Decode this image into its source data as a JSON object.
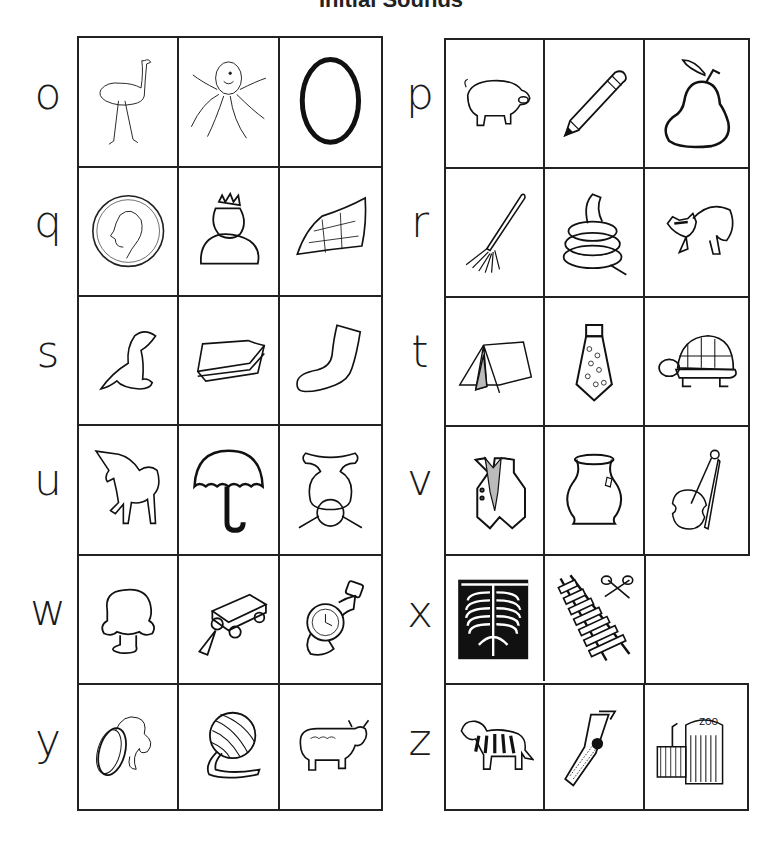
{
  "title": "Initial Sounds",
  "left_panel": {
    "rows": [
      {
        "letter": "o",
        "pictures": [
          "ostrich",
          "octopus",
          "oval"
        ]
      },
      {
        "letter": "q",
        "pictures": [
          "quarter",
          "queen",
          "quilt"
        ]
      },
      {
        "letter": "s",
        "pictures": [
          "seal",
          "sandwich",
          "sock"
        ]
      },
      {
        "letter": "u",
        "pictures": [
          "unicorn",
          "umbrella",
          "upside-down"
        ]
      },
      {
        "letter": "w",
        "pictures": [
          "wig",
          "wagon",
          "watch"
        ]
      },
      {
        "letter": "y",
        "pictures": [
          "yo-yo",
          "yarn",
          "yak"
        ]
      }
    ]
  },
  "right_panel": {
    "rows": [
      {
        "letter": "p",
        "pictures": [
          "pig",
          "pencil",
          "pear"
        ]
      },
      {
        "letter": "r",
        "pictures": [
          "rake",
          "rope",
          "raccoon"
        ]
      },
      {
        "letter": "t",
        "pictures": [
          "tent",
          "tie",
          "turtle"
        ]
      },
      {
        "letter": "v",
        "pictures": [
          "vest",
          "vase",
          "violin"
        ]
      },
      {
        "letter": "x",
        "pictures": [
          "x-ray",
          "xylophone"
        ]
      },
      {
        "letter": "z",
        "pictures": [
          "zebra",
          "zipper",
          "zoo"
        ]
      }
    ],
    "zoo_sign": "ZOO"
  }
}
